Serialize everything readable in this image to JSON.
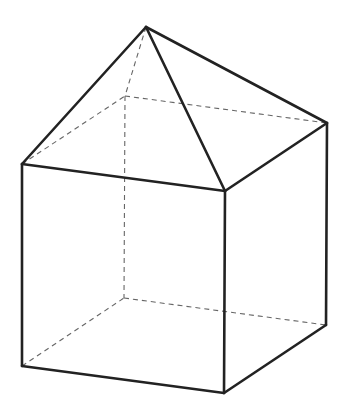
{
  "figure": {
    "width": 355,
    "height": 417,
    "colors": {
      "background": "#ffffff",
      "solid_edge": "#222222",
      "hidden_edge": "#666666"
    },
    "stroke": {
      "solid_width": 2.6,
      "hidden_width": 1.1,
      "dash": "5,4"
    },
    "vertices": {
      "apex": [
        146,
        27
      ],
      "top_front_left": [
        22,
        164
      ],
      "top_front_right": [
        225,
        191
      ],
      "top_back_right": [
        327,
        123
      ],
      "top_back_left": [
        125,
        96
      ],
      "bottom_front_left": [
        22,
        366
      ],
      "bottom_front_right": [
        224,
        393
      ],
      "bottom_back_right": [
        326,
        325
      ],
      "bottom_back_left": [
        124,
        298
      ]
    },
    "solid_edges": [
      [
        "apex",
        "top_front_left"
      ],
      [
        "apex",
        "top_front_right"
      ],
      [
        "apex",
        "top_back_right"
      ],
      [
        "top_front_left",
        "top_front_right"
      ],
      [
        "top_front_right",
        "top_back_right"
      ],
      [
        "top_front_left",
        "bottom_front_left"
      ],
      [
        "top_front_right",
        "bottom_front_right"
      ],
      [
        "top_back_right",
        "bottom_back_right"
      ],
      [
        "bottom_front_left",
        "bottom_front_right"
      ],
      [
        "bottom_front_right",
        "bottom_back_right"
      ]
    ],
    "hidden_edges": [
      [
        "apex",
        "top_back_left"
      ],
      [
        "top_front_left",
        "top_back_left"
      ],
      [
        "top_back_left",
        "top_back_right"
      ],
      [
        "top_back_left",
        "bottom_back_left"
      ],
      [
        "bottom_front_left",
        "bottom_back_left"
      ],
      [
        "bottom_back_left",
        "bottom_back_right"
      ]
    ]
  }
}
